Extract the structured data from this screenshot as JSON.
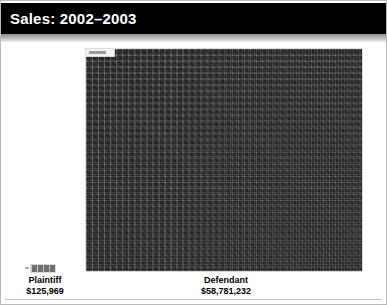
{
  "slide": {
    "title": "Sales: 2002–2003"
  },
  "chart_data": {
    "type": "bar",
    "title": "Sales: 2002–2003",
    "xlabel": "",
    "ylabel": "",
    "categories": [
      "Plaintiff",
      "Defendant"
    ],
    "values": [
      125969,
      58781232
    ],
    "value_labels": [
      "$125,969",
      "$58,781,232"
    ],
    "units": "USD",
    "grid": false,
    "legend": "none",
    "defendant_grid": {
      "columns": 46,
      "rows": 37,
      "cell_size_px": 6,
      "cell_color": "#6e6e6e",
      "gridline_color": "#cfcfcf"
    },
    "plaintiff_bar": {
      "columns": 4,
      "rows": 1,
      "cell_size_px": 6
    }
  },
  "colors": {
    "title_band": "#000000",
    "title_text": "#ffffff",
    "background": "#ffffff",
    "bar_fill": "#6e6e6e",
    "gridline": "#cfcfcf",
    "label_text": "#000000"
  },
  "labels": {
    "plaintiff": {
      "name": "Plaintiff",
      "value": "$125,969"
    },
    "defendant": {
      "name": "Defendant",
      "value": "$58,781,232"
    }
  }
}
